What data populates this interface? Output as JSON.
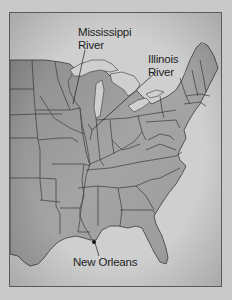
{
  "map": {
    "title": "Eastern United States",
    "labels": {
      "mississippi": [
        "Mississippi",
        "River"
      ],
      "illinois": [
        "Illinois",
        "River"
      ],
      "new_orleans": "New Orleans"
    },
    "colors": {
      "background": "#c9c9c9",
      "water": "#cfcfcf",
      "land_light": "#a9a9a9",
      "land_dark": "#7e7e7e",
      "border": "#3a3a3a",
      "frame": "#5a5a5a",
      "text": "#1e1e1e"
    },
    "markers": [
      {
        "name": "New Orleans",
        "x": 94,
        "y": 242
      }
    ]
  }
}
